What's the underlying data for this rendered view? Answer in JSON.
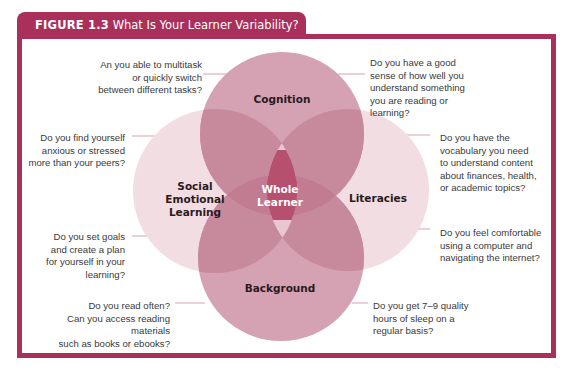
{
  "figure": {
    "label": "FIGURE 1.3",
    "title": "What Is Your Learner Variability?",
    "frame_color": "#a9305a"
  },
  "diagram": {
    "type": "venn",
    "center_label": "Whole\nLearner",
    "circles": [
      {
        "id": "cognition",
        "label": "Cognition",
        "color": "#d3a1b1"
      },
      {
        "id": "social-emotional-learning",
        "label": "Social\nEmotional\nLearning",
        "color": "#f1dbe2"
      },
      {
        "id": "literacies",
        "label": "Literacies",
        "color": "#f1dbe2"
      },
      {
        "id": "background",
        "label": "Background",
        "color": "#d3a1b1"
      }
    ],
    "center_color": "#b84f6f"
  },
  "questions": {
    "cognition_left": "An you able to multitask\nor quickly switch\nbetween different tasks?",
    "cognition_right": "Do you have a good\nsense of how well you\nunderstand something\nyou are reading or\nlearning?",
    "sel_top": "Do you find yourself\nanxious or stressed\nmore than your peers?",
    "sel_bottom": "Do you set goals\nand create a plan\nfor yourself in your\nlearning?",
    "literacies_top": "Do you have the\nvocabulary you need\nto understand content\nabout finances, health,\nor academic topics?",
    "literacies_bottom": "Do you feel comfortable\nusing a computer and\nnavigating the internet?",
    "background_left": "Do you read often?\nCan you access reading materials\nsuch as books or ebooks?",
    "background_right": "Do you get 7–9 quality\nhours of sleep on a\nregular basis?"
  }
}
